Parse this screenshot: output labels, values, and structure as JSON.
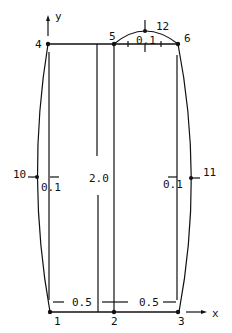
{
  "nodes": {
    "n1": "1",
    "n2": "2",
    "n3": "3",
    "n4": "4",
    "n5": "5",
    "n6": "6",
    "n10": "10",
    "n11": "11",
    "n12": "12"
  },
  "axes": {
    "x": "x",
    "y": "y"
  },
  "dimensions": {
    "bottom_left": "0.5",
    "bottom_right": "0.5",
    "height": "2.0",
    "left_bulge": "0.1",
    "right_bulge": "0.1",
    "top_bulge": "0.1"
  },
  "colors": {
    "line": "#111111",
    "background": "#ffffff"
  }
}
